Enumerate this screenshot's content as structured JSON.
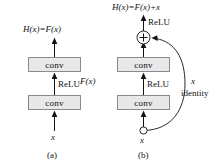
{
  "figure": {
    "colors": {
      "box_fill": "#e8e8e8",
      "box_border": "#8a8a8a",
      "line": "#111111",
      "background": "#ffffff"
    }
  },
  "panel_a": {
    "caption": "(a)",
    "output_label": "H(x)=F(x)",
    "input_label": "x",
    "blocks": [
      {
        "label": "conv"
      },
      {
        "label": "conv"
      }
    ],
    "activation_label": "ReLU",
    "branch_label": "F(x)"
  },
  "panel_b": {
    "caption": "(b)",
    "output_label": "H(x)=F(x)+x",
    "input_label": "x",
    "blocks": [
      {
        "label": "conv"
      },
      {
        "label": "conv"
      }
    ],
    "activation_top_label": "ReLU",
    "activation_mid_label": "ReLU",
    "sum_node_label": "+",
    "shortcut_label_var": "x",
    "shortcut_label_name": "identity"
  }
}
